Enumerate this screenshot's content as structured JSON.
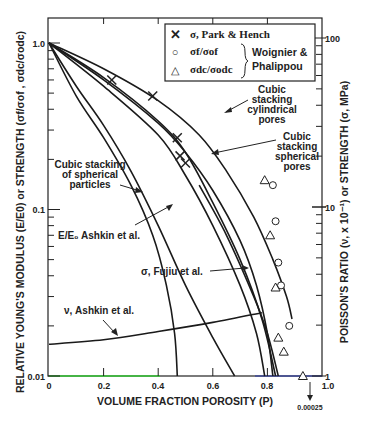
{
  "chart_data": {
    "type": "line",
    "title": "",
    "xlabel": "VOLUME FRACTION POROSITY (P)",
    "ylabel_left": "RELATIVE YOUNG'S MODULUS (E/E0) or STRENGTH (σf/σof , σdc/σodc)",
    "ylabel_right": "POISSON'S RATIO (ν, x 10⁻¹) or STRENGTH (σ, MPa)",
    "xlim": [
      0,
      1.0
    ],
    "ylim_left": [
      0.01,
      1.0
    ],
    "ylim_right": [
      1,
      100
    ],
    "yscale": "log",
    "x_ticks": [
      "0",
      "0.2",
      "0.4",
      "0.6",
      "0.8",
      "1.0"
    ],
    "y_ticks_left": [
      "0.01",
      "0.1",
      "1.0"
    ],
    "y_ticks_right": [
      "1",
      "10",
      "100"
    ],
    "below_axis_annotation": "0.00025",
    "legend": {
      "placement": "top-right",
      "entries": [
        {
          "marker": "x",
          "label": "σ, Park & Hench"
        },
        {
          "marker": "circle",
          "label": "σf/σof"
        },
        {
          "marker": "triangle",
          "label": "σdc/σodc"
        }
      ],
      "group_label_line1": "Woignier &",
      "group_label_line2": "Phalippou"
    },
    "curve_labels": {
      "cyl_pores": [
        "Cubic",
        "stacking",
        "cylindrical",
        "pores"
      ],
      "sph_pores": [
        "Cubic",
        "stacking",
        "spherical",
        "pores"
      ],
      "sph_particles": [
        "Cubic stacking",
        "of spherical",
        "particles"
      ],
      "e_ashkin": "E/E₀ Ashkin et al.",
      "fujiu": "σ, Fujiu et al.",
      "nu_ashkin": "ν, Ashkin et al."
    },
    "series": [
      {
        "name": "Cubic stacking cylindrical pores",
        "points": [
          [
            0,
            1.0
          ],
          [
            0.2,
            0.7
          ],
          [
            0.4,
            0.45
          ],
          [
            0.55,
            0.28
          ],
          [
            0.65,
            0.17
          ],
          [
            0.75,
            0.09
          ],
          [
            0.82,
            0.05
          ],
          [
            0.87,
            0.03
          ],
          [
            0.89,
            0.022
          ]
        ]
      },
      {
        "name": "Cubic stacking spherical pores",
        "points": [
          [
            0,
            1.0
          ],
          [
            0.2,
            0.6
          ],
          [
            0.4,
            0.33
          ],
          [
            0.5,
            0.22
          ],
          [
            0.6,
            0.13
          ],
          [
            0.7,
            0.065
          ],
          [
            0.76,
            0.035
          ],
          [
            0.8,
            0.018
          ],
          [
            0.82,
            0.01
          ]
        ]
      },
      {
        "name": "Upper middle curve",
        "points": [
          [
            0,
            1.0
          ],
          [
            0.2,
            0.62
          ],
          [
            0.4,
            0.34
          ],
          [
            0.5,
            0.22
          ],
          [
            0.6,
            0.11
          ],
          [
            0.7,
            0.05
          ],
          [
            0.78,
            0.022
          ],
          [
            0.83,
            0.01
          ]
        ]
      },
      {
        "name": "Lower middle curve",
        "points": [
          [
            0,
            1.0
          ],
          [
            0.2,
            0.55
          ],
          [
            0.4,
            0.28
          ],
          [
            0.5,
            0.16
          ],
          [
            0.6,
            0.08
          ],
          [
            0.7,
            0.035
          ],
          [
            0.76,
            0.018
          ],
          [
            0.79,
            0.01
          ]
        ]
      },
      {
        "name": "Cubic stacking of spherical particles",
        "points": [
          [
            0,
            1.0
          ],
          [
            0.1,
            0.55
          ],
          [
            0.2,
            0.32
          ],
          [
            0.3,
            0.17
          ],
          [
            0.4,
            0.08
          ],
          [
            0.5,
            0.035
          ],
          [
            0.6,
            0.017
          ],
          [
            0.68,
            0.01
          ]
        ]
      },
      {
        "name": "E/E0 Ashkin et al.",
        "points": [
          [
            0,
            1.0
          ],
          [
            0.1,
            0.48
          ],
          [
            0.2,
            0.27
          ],
          [
            0.3,
            0.14
          ],
          [
            0.38,
            0.07
          ],
          [
            0.43,
            0.035
          ],
          [
            0.46,
            0.018
          ],
          [
            0.47,
            0.01
          ]
        ]
      },
      {
        "name": "σ, Fujiu et al.",
        "points": [
          [
            0.55,
            0.14
          ],
          [
            0.65,
            0.07
          ],
          [
            0.75,
            0.03
          ],
          [
            0.8,
            0.018
          ],
          [
            0.84,
            0.01
          ]
        ]
      },
      {
        "name": "ν, Ashkin et al.",
        "points": [
          [
            0,
            0.0155
          ],
          [
            0.2,
            0.0165
          ],
          [
            0.4,
            0.0185
          ],
          [
            0.6,
            0.021
          ],
          [
            0.78,
            0.024
          ]
        ]
      }
    ],
    "markers": {
      "x": [
        [
          0.23,
          0.6
        ],
        [
          0.38,
          0.48
        ],
        [
          0.47,
          0.27
        ],
        [
          0.48,
          0.21
        ],
        [
          0.5,
          0.19
        ]
      ],
      "circle": [
        [
          0.82,
          0.14
        ],
        [
          0.83,
          0.085
        ],
        [
          0.84,
          0.048
        ],
        [
          0.85,
          0.035
        ],
        [
          0.88,
          0.02
        ]
      ],
      "triangle": [
        [
          0.79,
          0.15
        ],
        [
          0.81,
          0.07
        ],
        [
          0.83,
          0.034
        ],
        [
          0.84,
          0.017
        ],
        [
          0.86,
          0.014
        ],
        [
          0.93,
          0.01
        ]
      ]
    }
  }
}
